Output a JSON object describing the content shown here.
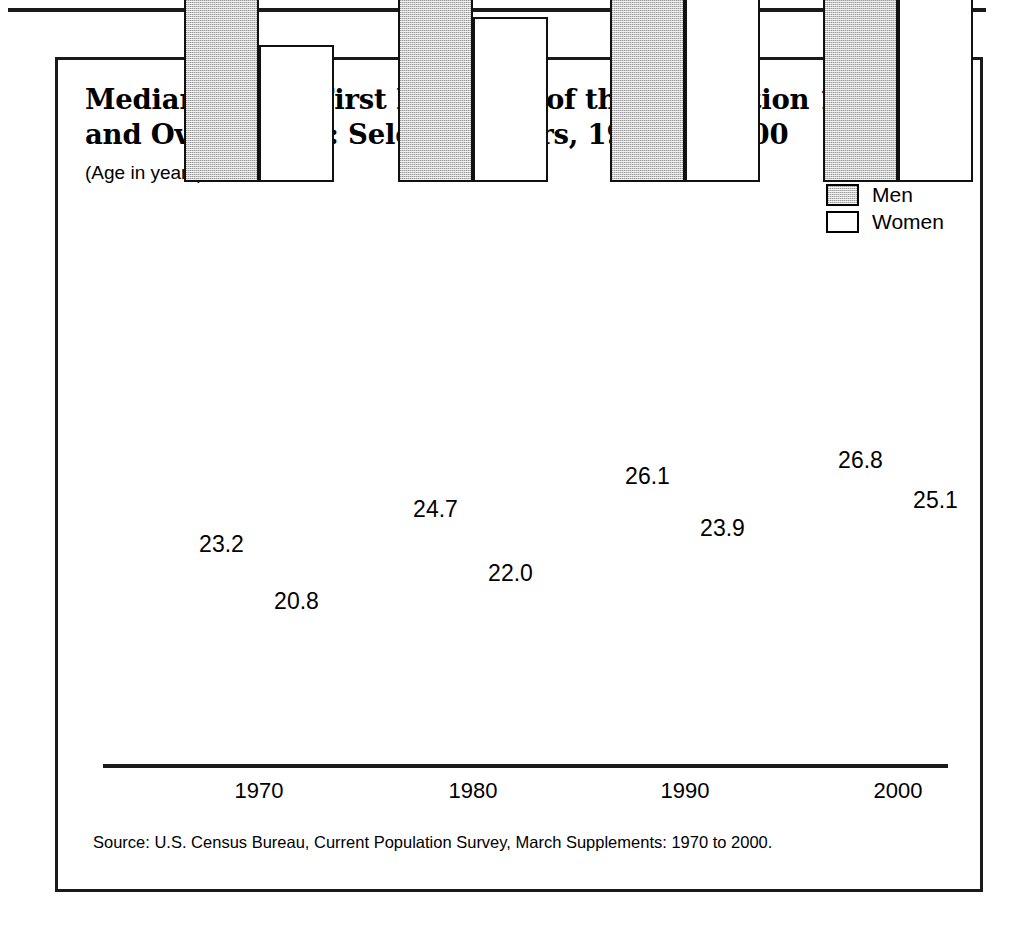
{
  "figure": {
    "title": "Median Age at First Marriage of the Population 15 Years\nand Over by Sex:  Selected Years, 1970 to 2000",
    "subtitle": "(Age in years)",
    "source": "Source: U.S. Census Bureau, Current Population Survey, March Supplements:  1970 to 2000.",
    "colors": {
      "men_fill": "#c9c9c9",
      "women_fill": "#ffffff",
      "outline": "#111111",
      "frame": "#1a1a1a",
      "text": "#000000"
    }
  },
  "legend": {
    "position": "top-right",
    "items": [
      {
        "label": "Men",
        "swatch": "men-swatch"
      },
      {
        "label": "Women",
        "swatch": "women-swatch"
      }
    ]
  },
  "chart_data": {
    "type": "bar",
    "title": "Median Age at First Marriage of the Population 15 Years and Over by Sex:  Selected Years, 1970 to 2000",
    "subtitle": "(Age in years)",
    "xlabel": "",
    "ylabel": "Age in years",
    "categories": [
      "1970",
      "1980",
      "1990",
      "2000"
    ],
    "series": [
      {
        "name": "Men",
        "values": [
          23.2,
          24.7,
          26.1,
          26.8
        ]
      },
      {
        "name": "Women",
        "values": [
          20.8,
          22.0,
          23.9,
          25.1
        ]
      }
    ],
    "value_labels": [
      [
        "23.2",
        "20.8"
      ],
      [
        "24.7",
        "22.0"
      ],
      [
        "26.1",
        "23.9"
      ],
      [
        "26.8",
        "25.1"
      ]
    ],
    "grid": false,
    "legend_position": "top-right",
    "axis_visible": {
      "x": true,
      "y": false
    },
    "bar_baseline_value": 15.0,
    "ylim": [
      15.0,
      30.0
    ]
  },
  "ticks": {
    "x": [
      "1970",
      "1980",
      "1990",
      "2000"
    ]
  }
}
